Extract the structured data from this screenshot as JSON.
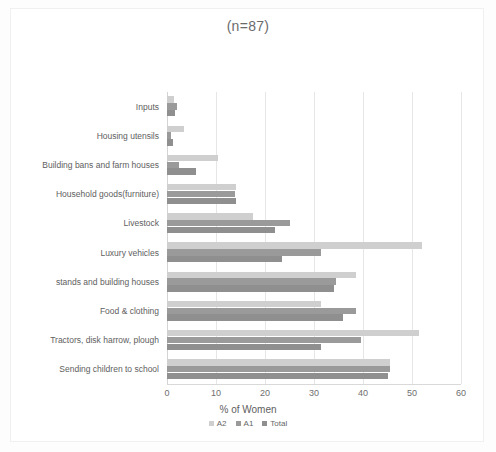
{
  "chart_data": {
    "type": "bar",
    "orientation": "horizontal",
    "title": "(n=87)",
    "xlabel": "% of Women",
    "ylabel": "",
    "xlim": [
      0,
      60
    ],
    "xticks": [
      0,
      10,
      20,
      30,
      40,
      50,
      60
    ],
    "grid": true,
    "legend_position": "bottom",
    "categories": [
      "Inputs",
      "Housing utensils",
      "Building bans and farm houses",
      "Household goods(furniture)",
      "Livestock",
      "Luxury vehicles",
      "stands and building houses",
      "Food & clothing",
      "Tractors, disk harrow, plough",
      "Sending children to school"
    ],
    "series": [
      {
        "name": "A2",
        "color": "#cfcfcf",
        "values": [
          1.5,
          3.5,
          10.5,
          14.0,
          17.5,
          52.0,
          38.5,
          31.5,
          51.5,
          45.5
        ]
      },
      {
        "name": "A1",
        "color": "#9a9a9a",
        "values": [
          2.0,
          0.8,
          2.5,
          13.8,
          25.0,
          31.5,
          34.5,
          38.5,
          39.5,
          45.5
        ]
      },
      {
        "name": "Total",
        "color": "#8f8f8f",
        "values": [
          1.6,
          1.2,
          6.0,
          14.0,
          22.0,
          23.5,
          34.0,
          36.0,
          31.5,
          45.0
        ]
      }
    ]
  },
  "legend": {
    "items": [
      {
        "label": "A2"
      },
      {
        "label": "A1"
      },
      {
        "label": "Total"
      }
    ]
  }
}
